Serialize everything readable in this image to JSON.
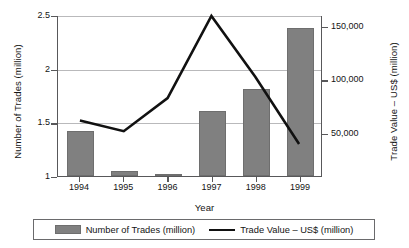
{
  "chart_data": {
    "type": "bar",
    "title": "",
    "xlabel": "Year",
    "ylabel": "Number of Trades (million)",
    "y2label": "Trade Value – US$ (million)",
    "categories": [
      "1994",
      "1995",
      "1996",
      "1997",
      "1998",
      "1999"
    ],
    "grid": true,
    "legend_position": "bottom",
    "ylim": [
      1,
      2.5
    ],
    "y_ticks": [
      "1",
      "1.5",
      "2",
      "2.5"
    ],
    "y_tick_values": [
      1,
      1.5,
      2,
      2.5
    ],
    "y2lim": [
      10000,
      160000
    ],
    "y2_ticks": [
      "50,000",
      "100,000",
      "150,000"
    ],
    "y2_tick_values": [
      50000,
      100000,
      150000
    ],
    "series": [
      {
        "name": "Number of Trades (million)",
        "type": "bar",
        "axis": "left",
        "color": "#808080",
        "values": [
          1.42,
          1.05,
          1.01,
          1.61,
          1.81,
          2.38
        ]
      },
      {
        "name": "Trade Value – US$ (million)",
        "type": "line",
        "axis": "right",
        "color": "#111111",
        "values": [
          62000,
          52000,
          83000,
          160000,
          103000,
          40000
        ]
      }
    ]
  },
  "legend": {
    "items": [
      {
        "label": "Number of Trades (million)",
        "marker": "bar-swatch"
      },
      {
        "label": "Trade Value – US$ (million)",
        "marker": "line-swatch"
      }
    ]
  }
}
